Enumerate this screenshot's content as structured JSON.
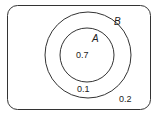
{
  "diagram": {
    "type": "venn",
    "universe_value": "0.2",
    "sets": [
      {
        "name": "B",
        "label": "B",
        "region_value": "0.1"
      },
      {
        "name": "A",
        "label": "A",
        "region_value": "0.7"
      }
    ],
    "relation": "A subset of B"
  }
}
